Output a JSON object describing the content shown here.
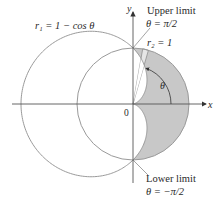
{
  "figure": {
    "type": "polar-region-diagram",
    "origin_px": [
      133,
      104
    ],
    "unit_px": 56,
    "colors": {
      "background": "#ffffff",
      "axis": "#555555",
      "curve": "#9a9a9a",
      "shaded_region": "#c8c8c8",
      "sector": "#e6e6e6",
      "text": "#2a2a2a"
    }
  },
  "axes": {
    "x_label": "x",
    "y_label": "y",
    "origin_label": "0"
  },
  "curves": [
    {
      "name": "cardioid",
      "label": "r₁ = 1 − cos θ",
      "equation": "r = 1 - cos(theta)"
    },
    {
      "name": "circle",
      "label": "r₂ = 1",
      "equation": "r = 1"
    }
  ],
  "labels": {
    "r1_label": "r₁ = 1 − cos θ",
    "r2_label": "r₂ = 1",
    "theta_label": "θ",
    "upper_limit_title": "Upper limit",
    "upper_limit_value": "θ = π/2",
    "lower_limit_title": "Lower limit",
    "lower_limit_value": "θ = −π/2"
  },
  "region": {
    "description": "Region inside r = 1 and outside r = 1 - cos θ",
    "theta_min": "-π/2",
    "theta_max": "π/2"
  },
  "sector": {
    "theta_start_deg": 74,
    "theta_end_deg": 80
  },
  "theta_arc": {
    "radius_px": 38,
    "from_deg": 0,
    "to_deg": 70
  }
}
